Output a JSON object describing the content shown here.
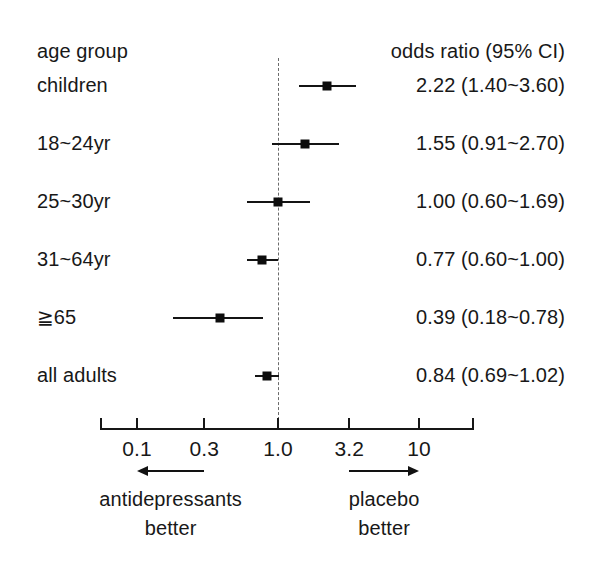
{
  "figure": {
    "type": "forest-plot",
    "background": "#ffffff",
    "ink_color": "#141414",
    "reference_line_color": "#6b6b6b"
  },
  "columns": {
    "left_header": "age group",
    "right_header": "odds ratio (95% CI)"
  },
  "chart_data": {
    "type": "forest",
    "title": "",
    "xlabel": "",
    "ylabel": "",
    "xscale": "log",
    "xlim": [
      0.063,
      15.8
    ],
    "grid": false,
    "reference_value": 1.0,
    "effect_measure": "odds ratio",
    "ci_level": "95% CI",
    "xticks": [
      0.1,
      0.3,
      1.0,
      3.2,
      10
    ],
    "xtick_labels": [
      "0.1",
      "0.3",
      "1.0",
      "3.2",
      "10"
    ],
    "categories": [
      "children",
      "18~24yr",
      "25~30yr",
      "31~64yr",
      "≧65",
      "all adults"
    ],
    "rows": [
      {
        "label": "children",
        "estimate": 2.22,
        "ci_low": 1.4,
        "ci_high": 3.6,
        "display": "2.22 (1.40~3.60)"
      },
      {
        "label": "18~24yr",
        "estimate": 1.55,
        "ci_low": 0.91,
        "ci_high": 2.7,
        "display": "1.55 (0.91~2.70)"
      },
      {
        "label": "25~30yr",
        "estimate": 1.0,
        "ci_low": 0.6,
        "ci_high": 1.69,
        "display": "1.00 (0.60~1.69)"
      },
      {
        "label": "31~64yr",
        "estimate": 0.77,
        "ci_low": 0.6,
        "ci_high": 1.0,
        "display": "0.77 (0.60~1.00)"
      },
      {
        "label": "≧65",
        "estimate": 0.39,
        "ci_low": 0.18,
        "ci_high": 0.78,
        "display": "0.39 (0.18~0.78)"
      },
      {
        "label": "all adults",
        "estimate": 0.84,
        "ci_low": 0.69,
        "ci_high": 1.02,
        "display": "0.84 (0.69~1.02)"
      }
    ],
    "annotations": [
      {
        "id": "left-direction",
        "direction": "left",
        "line1": "antidepressants",
        "line2": "better",
        "span": [
          0.1,
          0.3
        ]
      },
      {
        "id": "right-direction",
        "direction": "right",
        "line1": "placebo",
        "line2": "better",
        "span": [
          3.2,
          10
        ]
      }
    ]
  }
}
